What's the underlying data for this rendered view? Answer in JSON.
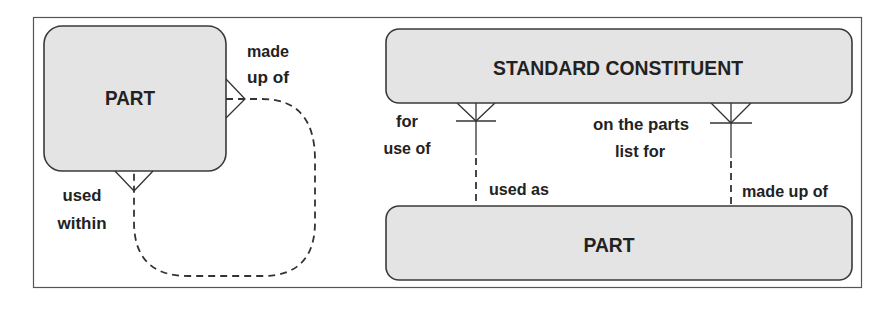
{
  "diagram": {
    "left_panel": {
      "entity": {
        "label": "PART"
      },
      "recursive_relationship": {
        "end_made_up_of": {
          "line1": "made",
          "line2": "up of"
        },
        "end_used_within": {
          "line1": "used",
          "line2": "within"
        }
      }
    },
    "right_panel": {
      "top_entity": {
        "label": "STANDARD CONSTITUENT"
      },
      "bottom_entity": {
        "label": "PART"
      },
      "relationship_left": {
        "top_end": {
          "line1": "for",
          "line2": "use of"
        },
        "bottom_end": {
          "label": "used as"
        }
      },
      "relationship_right": {
        "top_end": {
          "line1": "on the parts",
          "line2": "list for"
        },
        "bottom_end": {
          "label": "made up of"
        }
      }
    },
    "colors": {
      "entity_fill": "#e4e4e4",
      "entity_stroke": "#3a3a3a",
      "text": "#222222",
      "line": "#333333"
    }
  }
}
